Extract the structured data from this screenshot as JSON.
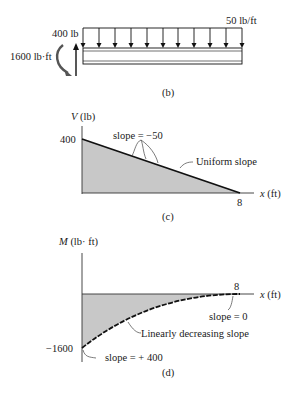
{
  "figure_b": {
    "caption": "(b)",
    "distributed_load_label": "50 lb/ft",
    "point_force_label": "400 lb",
    "moment_label": "1600 lb·ft",
    "arrow_count": 11
  },
  "figure_c": {
    "caption": "(c)",
    "y_axis_label": "V (lb)",
    "x_axis_label": "x (ft)",
    "y_tick": "400",
    "x_tick": "8",
    "annotation_slope": "slope = −50",
    "annotation_uniform": "Uniform slope"
  },
  "figure_d": {
    "caption": "(d)",
    "y_axis_label": "M (lb· ft)",
    "x_axis_label": "x (ft)",
    "y_tick": "−1600",
    "x_tick": "8",
    "annotation_slope_zero": "slope = 0",
    "annotation_linear": "Linearly decreasing slope",
    "annotation_slope_start": "slope = + 400"
  },
  "colors": {
    "fill": "#c8c8c8",
    "line": "#111111"
  }
}
